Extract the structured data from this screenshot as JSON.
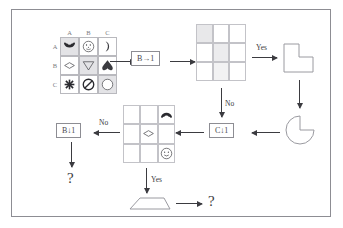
{
  "diagram": {
    "colors": {
      "frame_border": "#8d8d93",
      "grid_line": "#c3c3c8",
      "shade": "#e8e8ea",
      "stroke": "#3b3b40",
      "label_gray": "#7b7b80",
      "background": "#ffffff"
    },
    "matrix": {
      "name": "shape-matrix",
      "column_headers": [
        "A",
        "B",
        "C"
      ],
      "row_headers": [
        "A",
        "B",
        "C"
      ],
      "cells": [
        [
          {
            "icon": "filled-arc-bowl-icon",
            "shaded": true
          },
          {
            "icon": "dotted-face-circle-icon",
            "shaded": false
          },
          {
            "icon": "crescent-moon-icon",
            "shaded": false
          }
        ],
        [
          {
            "icon": "diamond-outline-icon",
            "shaded": false
          },
          {
            "icon": "down-triangle-outline-icon",
            "shaded": true
          },
          {
            "icon": "filled-spade-icon",
            "shaded": false
          }
        ],
        [
          {
            "icon": "asterisk-star-icon",
            "shaded": false
          },
          {
            "icon": "prohibition-sign-icon",
            "shaded": false
          },
          {
            "icon": "circle-outline-icon",
            "shaded": true
          }
        ]
      ]
    },
    "rule_boxes": [
      {
        "name": "rule-b-right-1",
        "label": "B→1"
      },
      {
        "name": "rule-c-down-1",
        "label": "C↓1"
      },
      {
        "name": "rule-b-down-1",
        "label": "B↓1"
      }
    ],
    "shaded_grid": {
      "name": "shaded-grid",
      "shaded_cells": [
        [
          true,
          false,
          false
        ],
        [
          false,
          true,
          false
        ],
        [
          false,
          true,
          false
        ]
      ]
    },
    "shape_grid": {
      "name": "shape-grid",
      "cells": [
        [
          "",
          "",
          "arc-cap-icon"
        ],
        [
          "",
          "diamond-outline-icon",
          ""
        ],
        [
          "",
          "",
          "smiley-face-icon"
        ]
      ]
    },
    "shapes": {
      "l_polygon": "l-shaped-polygon",
      "pie_wedge": "pac-man-pie-shape",
      "trapezoid": "trapezoid-shape"
    },
    "edge_labels": {
      "yes_top": "Yes",
      "no_mid": "No",
      "no_left": "No",
      "yes_bottom": "Yes"
    },
    "outputs": {
      "left_unknown": "?",
      "bottom_unknown": "?"
    }
  }
}
